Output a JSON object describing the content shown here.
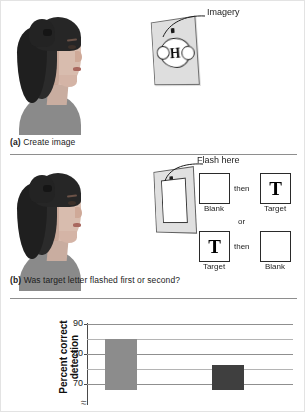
{
  "figure": {
    "panels": [
      {
        "id": "a",
        "caption_prefix": "(a)",
        "caption_text": "Create image",
        "annotation": "Imagery",
        "card_letter": "H"
      },
      {
        "id": "b",
        "caption_prefix": "(b)",
        "caption_text": "Was target letter flashed first or second?",
        "annotation": "Flash here",
        "sequence_row_1": {
          "first_box_letter": "",
          "first_box_label": "Blank",
          "connector": "then",
          "second_box_letter": "T",
          "second_box_label": "Target"
        },
        "alternative_connector": "or",
        "sequence_row_2": {
          "first_box_letter": "T",
          "first_box_label": "Target",
          "connector": "then",
          "second_box_letter": "",
          "second_box_label": "Blank"
        }
      }
    ]
  },
  "chart_data": {
    "type": "bar",
    "title": "",
    "xlabel": "",
    "ylabel": "Percent correct detection",
    "ylabel_line1": "Percent correct",
    "ylabel_line2": "detection",
    "categories": [
      "Condition 1",
      "Condition 2"
    ],
    "values": [
      85,
      76.5
    ],
    "ylim": [
      68,
      91
    ],
    "yticks": [
      70,
      80,
      90
    ],
    "ytick_labels": [
      "70",
      "80",
      "90"
    ],
    "minor_gridlines": [
      75,
      85
    ],
    "grid": true,
    "axis_break": true,
    "legend": "none",
    "bar_colors": [
      "#8c8c8c",
      "#3f3f3f"
    ]
  }
}
